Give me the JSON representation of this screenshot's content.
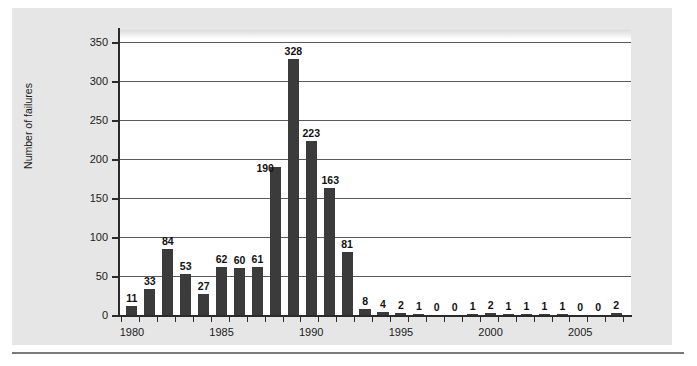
{
  "chart_data": {
    "type": "bar",
    "title": "",
    "xlabel": "",
    "ylabel": "Number of failures",
    "ylim": [
      0,
      365
    ],
    "yticks": [
      0,
      50,
      100,
      150,
      200,
      250,
      300,
      350
    ],
    "ytick_labels": [
      "0",
      "50",
      "100",
      "150",
      "200",
      "250",
      "300",
      "350"
    ],
    "xtick_labels": [
      "1980",
      "1985",
      "1990",
      "1995",
      "2000",
      "2005"
    ],
    "xtick_values": [
      1980,
      1985,
      1990,
      1995,
      2000,
      2005
    ],
    "grid": "horizontal",
    "legend": "none",
    "bar_color": "#3b3b3b",
    "categories": [
      "1980",
      "1981",
      "1982",
      "1983",
      "1984",
      "1985",
      "1986",
      "1987",
      "1988",
      "1989",
      "1990",
      "1991",
      "1992",
      "1993",
      "1994",
      "1995",
      "1996",
      "1997",
      "1998",
      "1999",
      "2000",
      "2001",
      "2002",
      "2003",
      "2004",
      "2005",
      "2006",
      "2007"
    ],
    "values": [
      11,
      33,
      84,
      53,
      27,
      62,
      60,
      61,
      190,
      328,
      223,
      163,
      81,
      8,
      4,
      2,
      1,
      0,
      0,
      1,
      2,
      1,
      1,
      1,
      1,
      0,
      0,
      2
    ],
    "data_labels": [
      "11",
      "33",
      "84",
      "53",
      "27",
      "62",
      "60",
      "61",
      "190",
      "328",
      "223",
      "163",
      "81",
      "8",
      "4",
      "2",
      "1",
      "0",
      "0",
      "1",
      "2",
      "1",
      "1",
      "1",
      "1",
      "0",
      "0",
      "2"
    ]
  },
  "figure": {
    "panel_background": "#e6e6e6",
    "plot_background": "#ffffff",
    "axis_color": "#2b2b2b",
    "gridline_color": "#5a5a5a"
  }
}
